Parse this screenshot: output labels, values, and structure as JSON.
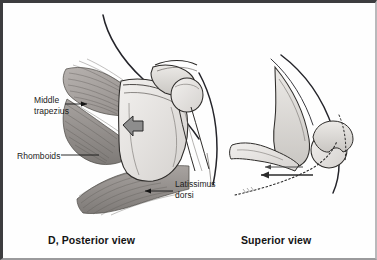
{
  "figure": {
    "background_color": "#ffffff",
    "border_color": "#3d3d3f",
    "ink_color": "#1b1b1b",
    "muscle_fill": "#9e9a98",
    "bone_fill": "#e2e0dd",
    "arrow_fill": "#8b8b8b"
  },
  "panels": {
    "left": {
      "caption_letter": "D",
      "caption": "D, Posterior view",
      "view_name": "Posterior view",
      "labels": [
        {
          "id": "middle-trapezius",
          "text": "Middle\ntrapezius",
          "leader": "arrow-right"
        },
        {
          "id": "rhomboids",
          "text": "Rhomboids",
          "leader": "line-right"
        },
        {
          "id": "latissimus-dorsi",
          "text": "Latissimus\ndorsi",
          "leader": "line-left"
        }
      ],
      "structures": [
        "neck-outline",
        "middle-trapezius-muscle",
        "rhomboid-muscle",
        "latissimus-dorsi-muscle",
        "scapula-bone",
        "acromion",
        "clavicle",
        "humeral-head",
        "humerus-shaft",
        "arm-outline",
        "scapula-motion-arrow"
      ]
    },
    "right": {
      "caption": "Superior view",
      "view_name": "Superior view",
      "structures": [
        "thorax-outline",
        "rib-cage-curve",
        "scapula-blade",
        "clavicle-bone",
        "humeral-head",
        "glenoid",
        "retraction-arrow",
        "dotted-soft-tissue-outline"
      ]
    }
  }
}
